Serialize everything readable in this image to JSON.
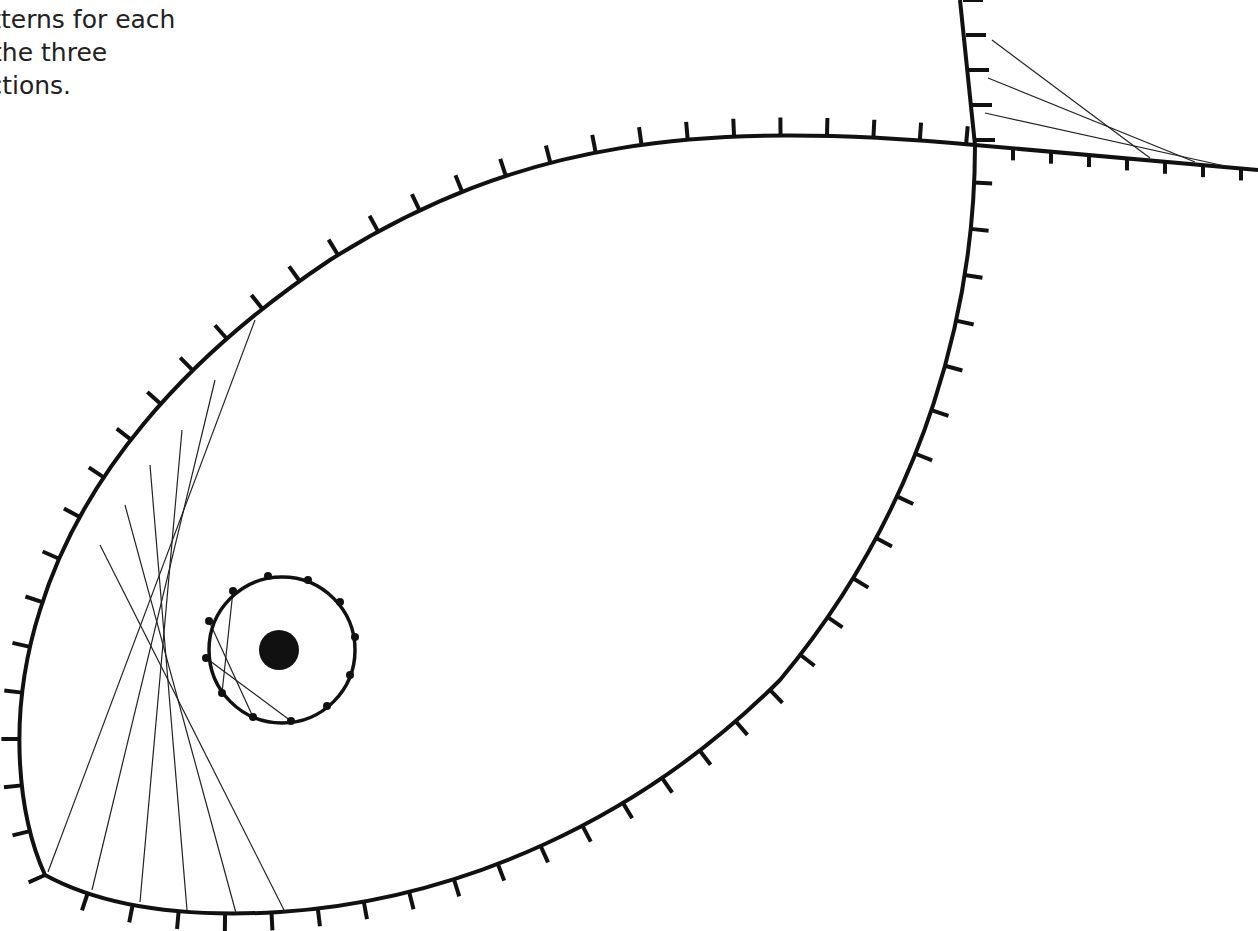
{
  "instructions": {
    "lines": [
      "r. Continue the",
      "patterns for each",
      "of the three",
      "sections."
    ]
  },
  "diagram": {
    "colors": {
      "stroke": "#111111",
      "background": "#ffffff"
    },
    "body_outline": "M45,875 C20,820 5,720 40,610 C80,480 180,360 330,260 C520,140 700,120 975,145 C975,300 930,500 780,680 C640,820 460,900 280,912 C180,918 100,905 45,875 Z",
    "tail_lines": [
      [
        960,
        0,
        975,
        145
      ],
      [
        975,
        145,
        1258,
        170
      ]
    ],
    "eye": {
      "cx": 282,
      "cy": 650,
      "r": 73,
      "pupil_r": 20
    },
    "eye_dots": [
      [
        268,
        576
      ],
      [
        308,
        580
      ],
      [
        340,
        602
      ],
      [
        355,
        637
      ],
      [
        350,
        675
      ],
      [
        327,
        706
      ],
      [
        291,
        721
      ],
      [
        253,
        717
      ],
      [
        222,
        693
      ],
      [
        206,
        658
      ],
      [
        209,
        621
      ],
      [
        233,
        591
      ]
    ],
    "eye_strings": [
      [
        233,
        591,
        222,
        693
      ],
      [
        209,
        621,
        253,
        717
      ],
      [
        206,
        658,
        291,
        721
      ]
    ],
    "fan_strings": [
      [
        48,
        872,
        255,
        320
      ],
      [
        92,
        890,
        215,
        380
      ],
      [
        140,
        902,
        182,
        430
      ],
      [
        187,
        910,
        150,
        465
      ],
      [
        236,
        913,
        125,
        505
      ],
      [
        285,
        912,
        100,
        545
      ]
    ],
    "tail_strings": [
      [
        992,
        40,
        1150,
        158
      ],
      [
        988,
        78,
        1195,
        162
      ],
      [
        985,
        113,
        1225,
        166
      ]
    ]
  }
}
